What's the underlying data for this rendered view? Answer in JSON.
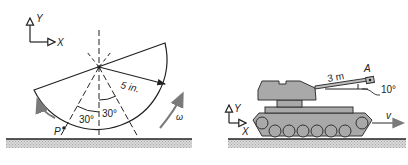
{
  "left_figure": {
    "axes": {
      "y_label": "Y",
      "x_label": "X"
    },
    "radius_label": "5 in.",
    "angle_left": "30°",
    "angle_right": "30°",
    "point_label": "P",
    "omega_label": "ω"
  },
  "right_figure": {
    "axes": {
      "y_label": "Y",
      "x_label": "X"
    },
    "barrel_length": "3 m",
    "point_label": "A",
    "barrel_angle": "10°",
    "velocity_label": "v"
  },
  "colors": {
    "line": "#222222",
    "tank_fill": "#a9a9a9",
    "ground_hatch": "#bdbdbd",
    "arrow_gray": "#7a7a7a"
  }
}
